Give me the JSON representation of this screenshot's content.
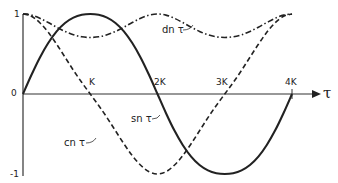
{
  "chart_data": {
    "type": "line",
    "title": "",
    "xlabel": "τ",
    "ylabel": "",
    "x_ticks": [
      "K",
      "2K",
      "3K",
      "4K"
    ],
    "y_ticks": [
      "1",
      "0",
      "-1"
    ],
    "ylim": [
      -1,
      1
    ],
    "xlim": [
      0,
      4
    ],
    "x_unit": "K",
    "grid": false,
    "legend": "inline labels",
    "modulus_m": 0.5,
    "x": [
      0,
      0.125,
      0.25,
      0.375,
      0.5,
      0.625,
      0.75,
      0.875,
      1.0,
      1.125,
      1.25,
      1.375,
      1.5,
      1.625,
      1.75,
      1.875,
      2.0,
      2.125,
      2.25,
      2.375,
      2.5,
      2.625,
      2.75,
      2.875,
      3.0,
      3.125,
      3.25,
      3.375,
      3.5,
      3.625,
      3.75,
      3.875,
      4.0
    ],
    "series": [
      {
        "name": "sn τ",
        "style": "solid",
        "values": [
          0,
          0.237,
          0.454,
          0.637,
          0.783,
          0.888,
          0.955,
          0.99,
          1.0,
          0.99,
          0.955,
          0.888,
          0.783,
          0.637,
          0.454,
          0.237,
          0,
          -0.237,
          -0.454,
          -0.637,
          -0.783,
          -0.888,
          -0.955,
          -0.99,
          -1.0,
          -0.99,
          -0.955,
          -0.888,
          -0.783,
          -0.637,
          -0.454,
          -0.237,
          0
        ]
      },
      {
        "name": "cn τ",
        "style": "dashed",
        "values": [
          1.0,
          0.972,
          0.891,
          0.771,
          0.622,
          0.46,
          0.296,
          0.143,
          0,
          -0.143,
          -0.296,
          -0.46,
          -0.622,
          -0.771,
          -0.891,
          -0.972,
          -1.0,
          -0.972,
          -0.891,
          -0.771,
          -0.622,
          -0.46,
          -0.296,
          -0.143,
          0,
          0.143,
          0.296,
          0.46,
          0.622,
          0.771,
          0.891,
          0.972,
          1.0
        ]
      },
      {
        "name": "dn τ",
        "style": "dash-dot",
        "values": [
          1.0,
          0.986,
          0.947,
          0.893,
          0.835,
          0.782,
          0.74,
          0.715,
          0.707,
          0.715,
          0.74,
          0.782,
          0.835,
          0.893,
          0.947,
          0.986,
          1.0,
          0.986,
          0.947,
          0.893,
          0.835,
          0.782,
          0.74,
          0.715,
          0.707,
          0.715,
          0.74,
          0.782,
          0.835,
          0.893,
          0.947,
          0.986,
          1.0
        ]
      }
    ],
    "annotations": [
      "sn τ",
      "cn τ",
      "dn τ"
    ]
  },
  "labels": {
    "y_one": "1",
    "y_zero": "0",
    "y_minus_one": "-1",
    "tick_k": "K",
    "tick_2k": "2K",
    "tick_3k": "3K",
    "tick_4k": "4K",
    "axis_tau": "τ",
    "sn": "sn τ",
    "cn": "cn τ",
    "dn": "dn τ"
  },
  "colors": {
    "ink": "#222222",
    "background": "#ffffff"
  }
}
